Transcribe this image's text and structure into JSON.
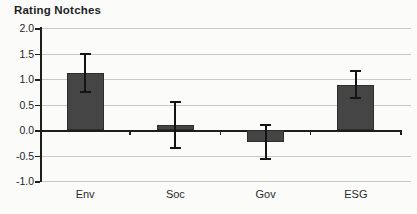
{
  "chart_data": {
    "type": "bar",
    "title": "Rating Notches",
    "categories": [
      "Env",
      "Soc",
      "Gov",
      "ESG"
    ],
    "values": [
      1.12,
      0.1,
      -0.24,
      0.88
    ],
    "error_low": [
      0.75,
      -0.36,
      -0.57,
      0.62
    ],
    "error_high": [
      1.5,
      0.54,
      0.1,
      1.15
    ],
    "ylim": [
      -1.0,
      2.0
    ],
    "ytick_step": 0.5,
    "ytick_labels": [
      "2.0",
      "1.5",
      "1.0",
      "0.5",
      "0.0",
      "-0.5",
      "-1.0"
    ],
    "xlabel": "",
    "ylabel": "",
    "grid": "horizontal",
    "legend": "none",
    "colors": {
      "bar": "#454545",
      "grid": "#c8c8c6",
      "axis": "#1e1e1e",
      "error": "#141414",
      "text": "#1f1f1f",
      "background": "#fbfbf9"
    }
  }
}
